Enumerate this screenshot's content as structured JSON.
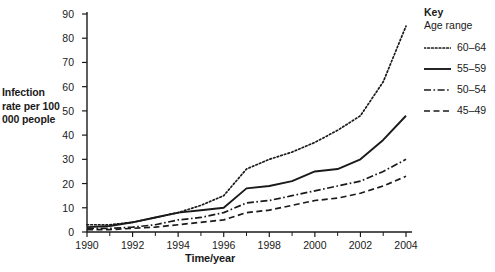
{
  "chart_data": {
    "type": "line",
    "title": "",
    "xlabel": "Time/year",
    "ylabel": "Infection rate per 100 000 people",
    "x": [
      1990,
      1991,
      1992,
      1993,
      1994,
      1995,
      1996,
      1997,
      1998,
      1999,
      2000,
      2001,
      2002,
      2003,
      2004
    ],
    "xlim": [
      1990,
      2004
    ],
    "ylim": [
      0,
      90
    ],
    "ytick_values": [
      0,
      10,
      20,
      30,
      40,
      50,
      60,
      70,
      80,
      90
    ],
    "ytick_labels": [
      "0",
      "10",
      "20",
      "30",
      "40",
      "50",
      "60",
      "70",
      "80",
      "90"
    ],
    "xtick_values": [
      1990,
      1992,
      1994,
      1996,
      1998,
      2000,
      2002,
      2004
    ],
    "xtick_labels": [
      "1990",
      "1992",
      "1994",
      "1996",
      "1998",
      "2000",
      "2002",
      "2004"
    ],
    "xminor_values": [
      1991,
      1993,
      1995,
      1997,
      1999,
      2001,
      2003
    ],
    "grid": false,
    "legend_position": "right",
    "series": [
      {
        "name": "60–64",
        "style": "dotted",
        "color": "#1a1a1a",
        "values": [
          3,
          3,
          4,
          6,
          8,
          11,
          15,
          26,
          30,
          33,
          37,
          42,
          48,
          62,
          85
        ]
      },
      {
        "name": "55–59",
        "style": "solid",
        "color": "#1a1a1a",
        "values": [
          2,
          2.5,
          4,
          6,
          8,
          9,
          10,
          18,
          19,
          21,
          25,
          26,
          30,
          38,
          48
        ]
      },
      {
        "name": "50–54",
        "style": "dash-dot",
        "color": "#1a1a1a",
        "values": [
          1.5,
          1.5,
          2,
          3,
          5,
          6,
          8,
          12,
          13,
          15,
          17,
          19,
          21,
          25,
          30
        ]
      },
      {
        "name": "45–49",
        "style": "dashed",
        "color": "#1a1a1a",
        "values": [
          1,
          1,
          1.5,
          2,
          3,
          4,
          5,
          8,
          9,
          11,
          13,
          14,
          16,
          19,
          23
        ]
      }
    ]
  },
  "legend": {
    "title": "Key",
    "subtitle": "Age range",
    "entries": [
      {
        "label": "60–64",
        "style": "dotted"
      },
      {
        "label": "55–59",
        "style": "solid"
      },
      {
        "label": "50–54",
        "style": "dash-dot"
      },
      {
        "label": "45–49",
        "style": "dashed"
      }
    ]
  },
  "axes": {
    "y_title": "Infection rate per 100 000 people",
    "x_title": "Time/year"
  }
}
